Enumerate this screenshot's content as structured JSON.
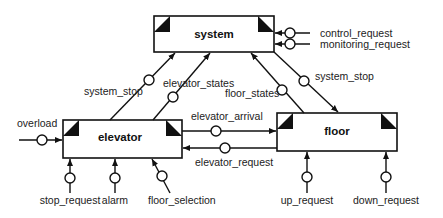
{
  "diagram": {
    "type": "data-flow / module interface diagram",
    "modules": {
      "system": {
        "label": "system"
      },
      "elevator": {
        "label": "elevator"
      },
      "floor": {
        "label": "floor"
      }
    },
    "flows": {
      "control_request": {
        "label": "control_request",
        "from": "external",
        "to": "system"
      },
      "monitoring_request": {
        "label": "monitoring_request",
        "from": "external",
        "to": "system"
      },
      "system_stop_left": {
        "label": "system_stop",
        "from": "elevator",
        "to": "system"
      },
      "elevator_states": {
        "label": "elevator_states",
        "from": "elevator",
        "to": "system"
      },
      "floor_states": {
        "label": "floor_states",
        "from": "floor",
        "to": "system"
      },
      "system_stop_right": {
        "label": "system_stop",
        "from": "system",
        "to": "floor"
      },
      "overload": {
        "label": "overload",
        "from": "external",
        "to": "elevator"
      },
      "elevator_arrival": {
        "label": "elevator_arrival",
        "from": "elevator",
        "to": "floor"
      },
      "elevator_request": {
        "label": "elevator_request",
        "from": "floor",
        "to": "elevator"
      },
      "stop_request": {
        "label": "stop_request",
        "from": "external",
        "to": "elevator"
      },
      "alarm": {
        "label": "alarm",
        "from": "external",
        "to": "elevator"
      },
      "floor_selection": {
        "label": "floor_selection",
        "from": "external",
        "to": "elevator"
      },
      "up_request": {
        "label": "up_request",
        "from": "external",
        "to": "floor"
      },
      "down_request": {
        "label": "down_request",
        "from": "external",
        "to": "floor"
      }
    }
  }
}
